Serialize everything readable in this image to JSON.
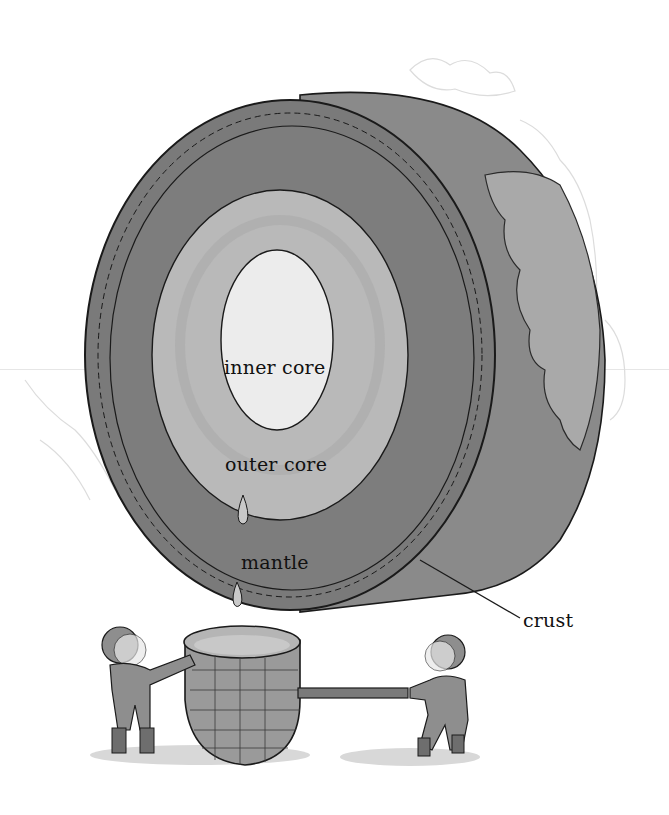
{
  "diagram": {
    "labels": {
      "inner_core": "inner core",
      "outer_core": "outer core",
      "mantle": "mantle",
      "crust": "crust"
    },
    "colors": {
      "background": "#ffffff",
      "crust_side": "#8a8a8a",
      "crust_rim": "#7a7a7a",
      "mantle": "#7d7d7d",
      "outer_core": "#b9b9b9",
      "inner_core": "#ececec",
      "continent": "#a9a9a9",
      "ink": "#1a1a1a",
      "figures": "#8e8e8e",
      "basket": "#9a9a9a"
    },
    "scene": {
      "figure_left": "astronaut holding basket",
      "figure_right": "astronaut pulling pole",
      "basket": "woven basket catching drips"
    }
  }
}
